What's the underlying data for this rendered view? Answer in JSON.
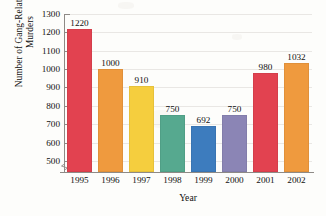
{
  "chart_data": {
    "type": "bar",
    "title": "",
    "xlabel": "Year",
    "ylabel": "Number of Gang-Related Murders",
    "ylabel_line1": "Number of Gang-Related",
    "ylabel_line2": "Murders",
    "categories": [
      "1995",
      "1996",
      "1997",
      "1998",
      "1999",
      "2000",
      "2001",
      "2002"
    ],
    "values": [
      1220,
      1000,
      910,
      750,
      692,
      750,
      980,
      1032
    ],
    "value_labels": [
      "1220",
      "1000",
      "910",
      "750",
      "692",
      "750",
      "980",
      "1032"
    ],
    "colors": [
      "#e24250",
      "#ef9a3e",
      "#f5ce3e",
      "#56a98f",
      "#3d7cbe",
      "#8b85b5",
      "#e24250",
      "#ef9a3e"
    ],
    "color_names": [
      "red",
      "orange",
      "yellow",
      "teal",
      "blue",
      "purple",
      "red",
      "orange"
    ],
    "ylim": [
      440,
      1300
    ],
    "y_ticks": [
      500,
      600,
      700,
      800,
      900,
      1000,
      1100,
      1200,
      1300
    ],
    "y_tick_labels": [
      "500",
      "600",
      "700",
      "800",
      "900",
      "1000",
      "1100",
      "1200",
      "1300"
    ],
    "grid": true,
    "grid_axis": "y",
    "legend": "none",
    "axis_break": true,
    "axis_break_note": "y-axis broken below 500"
  }
}
